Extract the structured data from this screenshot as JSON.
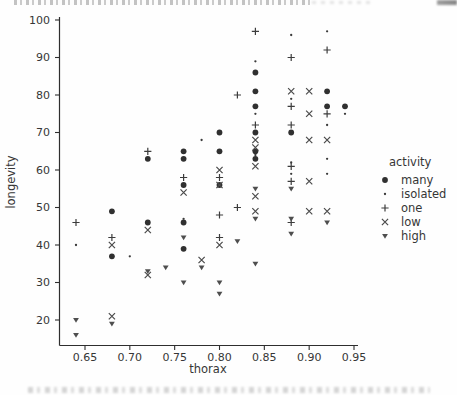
{
  "chart_data": {
    "type": "scatter",
    "title": "",
    "xlabel": "thorax",
    "ylabel": "longevity",
    "x_tick_labels": [
      "0.65",
      "0.70",
      "0.75",
      "0.80",
      "0.85",
      "0.90",
      "0.95"
    ],
    "x_tick_values": [
      0.65,
      0.7,
      0.75,
      0.8,
      0.85,
      0.9,
      0.95
    ],
    "y_tick_labels": [
      "20",
      "30",
      "40",
      "50",
      "60",
      "70",
      "80",
      "90",
      "100"
    ],
    "y_tick_values": [
      20,
      30,
      40,
      50,
      60,
      70,
      80,
      90,
      100
    ],
    "xlim": [
      0.62,
      0.955
    ],
    "ylim": [
      13,
      101
    ],
    "grid": false,
    "legend_position": "right",
    "legend_title": "activity",
    "axis_color": "#2e2e2e",
    "background": "#fefefe",
    "series": [
      {
        "name": "many",
        "marker": "filled-circle",
        "color": "#303030",
        "points": [
          [
            0.68,
            37
          ],
          [
            0.68,
            49
          ],
          [
            0.72,
            46
          ],
          [
            0.72,
            63
          ],
          [
            0.76,
            39
          ],
          [
            0.76,
            46
          ],
          [
            0.76,
            56
          ],
          [
            0.76,
            63
          ],
          [
            0.76,
            65
          ],
          [
            0.8,
            56
          ],
          [
            0.8,
            65
          ],
          [
            0.8,
            70
          ],
          [
            0.84,
            63
          ],
          [
            0.84,
            65
          ],
          [
            0.84,
            70
          ],
          [
            0.84,
            77
          ],
          [
            0.84,
            81
          ],
          [
            0.84,
            86
          ],
          [
            0.88,
            70
          ],
          [
            0.92,
            77
          ],
          [
            0.92,
            81
          ],
          [
            0.94,
            77
          ]
        ]
      },
      {
        "name": "isolated",
        "marker": "small-dot",
        "color": "#3a3a3a",
        "points": [
          [
            0.64,
            40
          ],
          [
            0.7,
            37
          ],
          [
            0.76,
            47
          ],
          [
            0.78,
            68
          ],
          [
            0.84,
            64
          ],
          [
            0.84,
            75
          ],
          [
            0.84,
            89
          ],
          [
            0.88,
            59
          ],
          [
            0.88,
            62
          ],
          [
            0.88,
            79
          ],
          [
            0.88,
            96
          ],
          [
            0.92,
            59
          ],
          [
            0.92,
            63
          ],
          [
            0.92,
            72
          ],
          [
            0.92,
            97
          ],
          [
            0.94,
            75
          ]
        ]
      },
      {
        "name": "one",
        "marker": "plus",
        "color": "#3c3c3c",
        "points": [
          [
            0.64,
            46
          ],
          [
            0.68,
            42
          ],
          [
            0.72,
            65
          ],
          [
            0.76,
            58
          ],
          [
            0.8,
            42
          ],
          [
            0.8,
            48
          ],
          [
            0.8,
            58
          ],
          [
            0.82,
            50
          ],
          [
            0.82,
            80
          ],
          [
            0.84,
            72
          ],
          [
            0.84,
            97
          ],
          [
            0.88,
            46
          ],
          [
            0.88,
            57
          ],
          [
            0.88,
            61
          ],
          [
            0.88,
            72
          ],
          [
            0.88,
            77
          ],
          [
            0.88,
            90
          ],
          [
            0.92,
            75
          ],
          [
            0.92,
            92
          ]
        ]
      },
      {
        "name": "low",
        "marker": "cross",
        "color": "#4a4a4a",
        "points": [
          [
            0.68,
            21
          ],
          [
            0.68,
            40
          ],
          [
            0.72,
            32
          ],
          [
            0.72,
            44
          ],
          [
            0.76,
            54
          ],
          [
            0.78,
            36
          ],
          [
            0.8,
            40
          ],
          [
            0.8,
            56
          ],
          [
            0.8,
            60
          ],
          [
            0.84,
            49
          ],
          [
            0.84,
            53
          ],
          [
            0.84,
            61
          ],
          [
            0.84,
            66
          ],
          [
            0.84,
            68
          ],
          [
            0.88,
            81
          ],
          [
            0.9,
            49
          ],
          [
            0.9,
            57
          ],
          [
            0.9,
            68
          ],
          [
            0.9,
            75
          ],
          [
            0.9,
            81
          ],
          [
            0.92,
            49
          ],
          [
            0.92,
            68
          ]
        ]
      },
      {
        "name": "high",
        "marker": "triangle-down",
        "color": "#4e4e4e",
        "points": [
          [
            0.64,
            16
          ],
          [
            0.64,
            20
          ],
          [
            0.68,
            19
          ],
          [
            0.72,
            33
          ],
          [
            0.74,
            34
          ],
          [
            0.76,
            30
          ],
          [
            0.76,
            42
          ],
          [
            0.78,
            34
          ],
          [
            0.8,
            27
          ],
          [
            0.8,
            30
          ],
          [
            0.82,
            41
          ],
          [
            0.84,
            35
          ],
          [
            0.84,
            47
          ],
          [
            0.84,
            55
          ],
          [
            0.88,
            43
          ],
          [
            0.88,
            47
          ],
          [
            0.88,
            55
          ],
          [
            0.92,
            46
          ]
        ]
      }
    ]
  }
}
